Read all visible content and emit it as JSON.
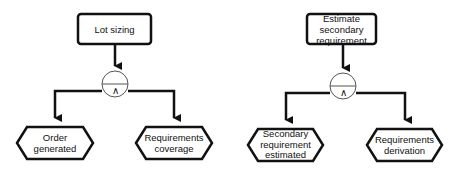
{
  "diagrams": [
    {
      "function": "Lot sizing",
      "operator": "∧",
      "events": [
        "Order generated",
        "Requirements coverage"
      ]
    },
    {
      "function": "Estimate secondary requirement",
      "operator": "∧",
      "events": [
        "Secondary requirement estimated",
        "Requirements derivation"
      ]
    }
  ],
  "colors": {
    "stroke": "#111111",
    "background": "#ffffff"
  }
}
